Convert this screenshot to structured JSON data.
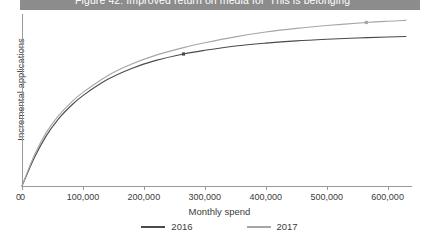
{
  "figure": {
    "title": "Figure 42: Improved return on media for 'This is belonging'",
    "title_band_color": "#8c8c8c",
    "title_text_color": "#ffffff"
  },
  "chart_data": {
    "type": "line",
    "title": "Figure 42: Improved return on media for 'This is belonging'",
    "xlabel": "Monthly spend",
    "ylabel": "Incremental applications",
    "xlim": [
      0,
      640000
    ],
    "ylim": [
      0,
      1.05
    ],
    "grid": false,
    "legend_position": "bottom-center",
    "xticks": [
      0,
      100000,
      200000,
      300000,
      400000,
      500000,
      600000
    ],
    "xticklabels": [
      "0",
      "100,000",
      "200,000",
      "300,000",
      "400,000",
      "500,000",
      "600,000"
    ],
    "yticks": [
      0
    ],
    "yticklabels": [
      "0"
    ],
    "series": [
      {
        "name": "2016",
        "color": "#4a4a4a",
        "x": [
          0,
          20000,
          40000,
          60000,
          80000,
          100000,
          140000,
          180000,
          220000,
          265000,
          300000,
          350000,
          400000,
          450000,
          500000,
          550000,
          600000,
          630000
        ],
        "values": [
          0,
          0.175,
          0.315,
          0.42,
          0.5,
          0.565,
          0.665,
          0.735,
          0.785,
          0.825,
          0.848,
          0.875,
          0.893,
          0.907,
          0.917,
          0.925,
          0.931,
          0.934
        ],
        "markers": [
          {
            "x": 265000,
            "y": 0.825
          }
        ]
      },
      {
        "name": "2017",
        "color": "#a6a6a6",
        "x": [
          0,
          20000,
          40000,
          60000,
          80000,
          100000,
          140000,
          180000,
          220000,
          265000,
          300000,
          350000,
          400000,
          450000,
          500000,
          565000,
          600000,
          630000
        ],
        "values": [
          0,
          0.19,
          0.335,
          0.44,
          0.52,
          0.585,
          0.688,
          0.762,
          0.818,
          0.865,
          0.895,
          0.932,
          0.962,
          0.985,
          1.003,
          1.022,
          1.03,
          1.035
        ],
        "markers": [
          {
            "x": 565000,
            "y": 1.022
          }
        ]
      }
    ]
  },
  "legend": {
    "items": [
      {
        "label": "2016",
        "color": "#4a4a4a"
      },
      {
        "label": "2017",
        "color": "#a6a6a6"
      }
    ]
  }
}
